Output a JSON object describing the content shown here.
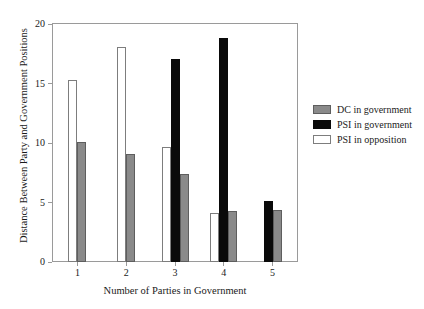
{
  "chart_data": {
    "type": "bar",
    "title": "",
    "subtitle": "",
    "xlabel": "Number of Parties in Government",
    "ylabel": "Distance Between Party and Government Positions",
    "categories": [
      "1",
      "2",
      "3",
      "4",
      "5"
    ],
    "ylim": [
      0,
      20
    ],
    "yticks": [
      0,
      5,
      10,
      15,
      20
    ],
    "ytick_labels": [
      "0",
      "5",
      "10",
      "15",
      "20"
    ],
    "grid": false,
    "legend_position": "right",
    "series": [
      {
        "name": "DC in government",
        "color": "#8a8a8a",
        "values": [
          10.1,
          9.1,
          7.4,
          4.3,
          4.4
        ]
      },
      {
        "name": "PSI in government",
        "color": "#0a0a0a",
        "values": [
          null,
          null,
          17.1,
          18.8,
          5.1
        ]
      },
      {
        "name": "PSI in opposition",
        "color": "#ffffff",
        "values": [
          15.3,
          18.1,
          9.7,
          4.1,
          null
        ]
      }
    ],
    "series_draw_order": [
      "PSI in opposition",
      "PSI in government",
      "DC in government"
    ],
    "legend_entries": [
      {
        "label": "DC in government",
        "swatch": "gray"
      },
      {
        "label": "PSI in government",
        "swatch": "black"
      },
      {
        "label": "PSI in opposition",
        "swatch": "white"
      }
    ]
  },
  "axes": {
    "y_title": "Distance Between Party and Government Positions",
    "x_title": "Number of Parties in Government",
    "y_labels": [
      "20",
      "15",
      "10",
      "5",
      "0"
    ],
    "x_labels": [
      "1",
      "2",
      "3",
      "4",
      "5"
    ]
  },
  "legend": {
    "items": [
      {
        "label": "DC in government"
      },
      {
        "label": "PSI in government"
      },
      {
        "label": "PSI in opposition"
      }
    ]
  }
}
